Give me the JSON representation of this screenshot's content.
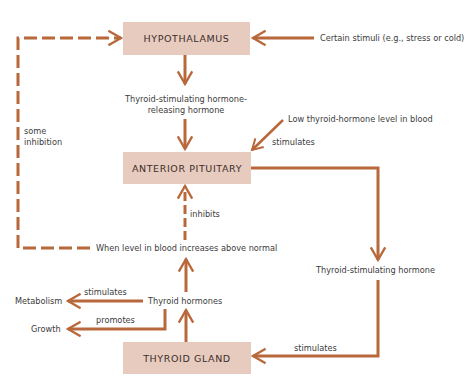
{
  "diagram": {
    "type": "flowchart",
    "topic": "Thyroid hormone regulation (negative feedback)",
    "colors": {
      "box_fill": "#e8cbbf",
      "arrow": "#b8683a",
      "text": "#3c3c3c"
    },
    "boxes": {
      "hypothalamus": "HYPOTHALAMUS",
      "anterior_pituitary": "ANTERIOR PITUITARY",
      "thyroid_gland": "THYROID GLAND"
    },
    "labels": {
      "certain_stimuli": "Certain stimuli (e.g., stress or cold)",
      "trh_line1": "Thyroid-stimulating hormone-",
      "trh_line2": "releasing hormone",
      "low_level": "Low thyroid-hormone level in blood",
      "stimulates_pituitary": "stimulates",
      "some": "some",
      "inhibition": "inhibition",
      "inhibits": "inhibits",
      "level_increase": "When level in blood increases above normal",
      "tsh": "Thyroid-stimulating hormone",
      "thyroid_hormones": "Thyroid hormones",
      "metabolism": "Metabolism",
      "stimulates_metabolism": "stimulates",
      "growth": "Growth",
      "promotes": "promotes",
      "stimulates_gland": "stimulates"
    },
    "edges": [
      {
        "from": "Certain stimuli",
        "to": "HYPOTHALAMUS",
        "style": "solid"
      },
      {
        "from": "HYPOTHALAMUS",
        "to": "Thyroid-stimulating hormone-releasing hormone",
        "style": "solid"
      },
      {
        "from": "Thyroid-stimulating hormone-releasing hormone",
        "to": "ANTERIOR PITUITARY",
        "style": "solid"
      },
      {
        "from": "Low thyroid-hormone level in blood",
        "to": "ANTERIOR PITUITARY",
        "label": "stimulates",
        "style": "solid"
      },
      {
        "from": "ANTERIOR PITUITARY",
        "to": "Thyroid-stimulating hormone",
        "style": "solid"
      },
      {
        "from": "Thyroid-stimulating hormone",
        "to": "THYROID GLAND",
        "label": "stimulates",
        "style": "solid"
      },
      {
        "from": "THYROID GLAND",
        "to": "Thyroid hormones",
        "style": "solid"
      },
      {
        "from": "Thyroid hormones",
        "to": "Metabolism",
        "label": "stimulates",
        "style": "solid"
      },
      {
        "from": "Thyroid hormones",
        "to": "Growth",
        "label": "promotes",
        "style": "solid"
      },
      {
        "from": "Thyroid hormones",
        "to": "When level in blood increases above normal",
        "style": "solid"
      },
      {
        "from": "When level in blood increases above normal",
        "to": "ANTERIOR PITUITARY",
        "label": "inhibits",
        "style": "dashed"
      },
      {
        "from": "When level in blood increases above normal",
        "to": "HYPOTHALAMUS",
        "label": "some inhibition",
        "style": "dashed"
      }
    ]
  }
}
